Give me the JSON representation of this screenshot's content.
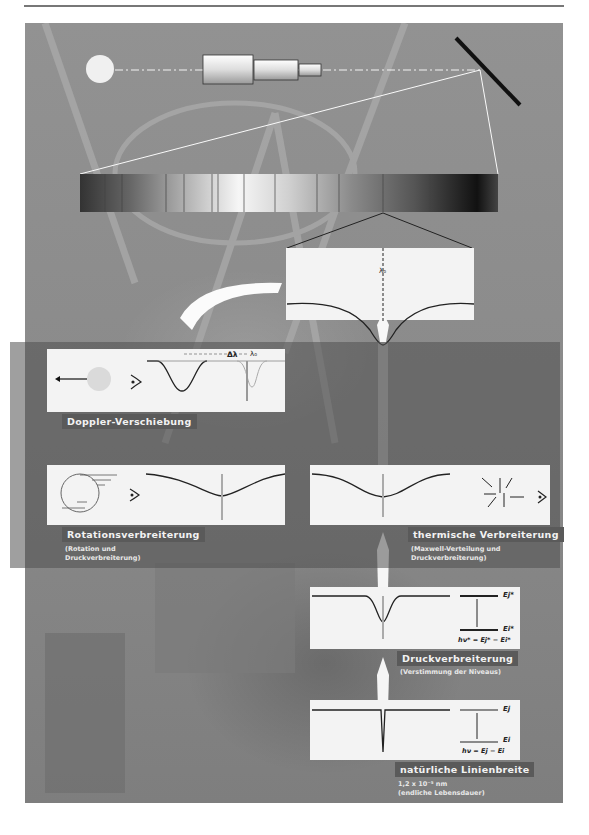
{
  "header": {
    "rule": true
  },
  "diagram": {
    "top": {
      "lambda0_label": "λ₀"
    },
    "doppler": {
      "title": "Doppler-Verschiebung",
      "delta_label": "Δλ",
      "lambda0_label": "λ₀"
    },
    "rotation": {
      "title": "Rotationsverbreiterung",
      "sub1": "(Rotation und",
      "sub2": "Druckverbreiterung)"
    },
    "thermal": {
      "title": "thermische Verbreiterung",
      "sub1": "(Maxwell-Verteilung und",
      "sub2": "Druckverbreiterung)"
    },
    "pressure": {
      "title": "Druckverbreiterung",
      "sub1": "(Verstimmung der Niveaus)",
      "level_upper": "Ej*",
      "level_lower": "Ei*",
      "equation": "hν* = Ej* − Ei*"
    },
    "natural": {
      "title": "natürliche Linienbreite",
      "sub1": "1,2 x 10⁻⁵ nm",
      "sub2": "(endliche Lebensdauer)",
      "level_upper": "Ej",
      "level_lower": "Ei",
      "equation": "hν = Ej − Ei"
    }
  },
  "colors": {
    "background_photo": "#8d8d8d",
    "overlay": "#505050",
    "card": "#f3f3f3",
    "label_bg": "#5a5a5a"
  }
}
